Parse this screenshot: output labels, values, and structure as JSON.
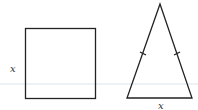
{
  "figure": {
    "shapes": [
      {
        "name": "square",
        "side_label": "x",
        "label_position": "left"
      },
      {
        "name": "isosceles-triangle",
        "base_label": "x",
        "equal_side_tick_marks": 2,
        "label_position": "below"
      }
    ],
    "colors": {
      "stroke": "#222222",
      "label": "#333333",
      "guide_line": "#dde3ec"
    }
  },
  "labels": {
    "square_side": "x",
    "triangle_base": "x"
  }
}
